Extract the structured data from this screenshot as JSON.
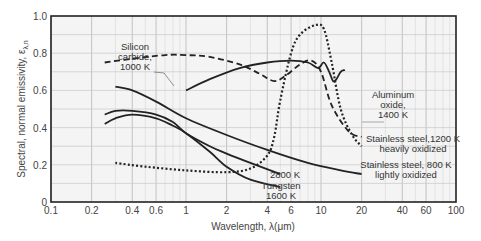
{
  "chart_data": {
    "type": "line",
    "title": "",
    "xlabel": "Wavelength, λ(μm)",
    "ylabel": "Spectral, normal emissivity, ε",
    "ylabel_subscript": "λ,n",
    "xscale": "log",
    "xlim": [
      0.1,
      100
    ],
    "ylim": [
      0,
      1.0
    ],
    "grid": true,
    "x_ticks": [
      0.1,
      0.2,
      0.4,
      0.6,
      1,
      2,
      4,
      6,
      10,
      20,
      40,
      60,
      100
    ],
    "x_tick_labels": [
      "0.1",
      "0.2",
      "0.4",
      "0.6",
      "1",
      "2",
      "4",
      "6",
      "10",
      "20",
      "40",
      "60",
      "100"
    ],
    "y_ticks": [
      0,
      0.2,
      0.4,
      0.6,
      0.8,
      1.0
    ],
    "y_tick_labels": [
      "0",
      "0.2",
      "0.4",
      "0.6",
      "0.8",
      "1.0"
    ],
    "series": [
      {
        "name": "Silicon carbide, 1000 K",
        "style": "dashed",
        "x": [
          0.25,
          0.4,
          0.7,
          1.0,
          1.5,
          2.5,
          3.5,
          4.5,
          5.5,
          7.0,
          8.5,
          10,
          12,
          16,
          20
        ],
        "y": [
          0.75,
          0.77,
          0.79,
          0.79,
          0.78,
          0.74,
          0.69,
          0.65,
          0.68,
          0.74,
          0.76,
          0.7,
          0.52,
          0.38,
          0.35
        ]
      },
      {
        "name": "Aluminum oxide, 1400 K",
        "style": "dotted",
        "x": [
          0.3,
          0.5,
          1.0,
          2.0,
          3.0,
          4.0,
          4.5,
          5.0,
          6.0,
          7.0,
          9.0,
          10.5,
          12,
          14,
          17,
          20
        ],
        "y": [
          0.21,
          0.19,
          0.17,
          0.16,
          0.18,
          0.25,
          0.35,
          0.55,
          0.8,
          0.9,
          0.95,
          0.93,
          0.75,
          0.5,
          0.36,
          0.3
        ]
      },
      {
        "name": "Stainless steel, 1200 K heavily oxidized",
        "style": "solid",
        "x": [
          1.0,
          1.5,
          2.5,
          4.0,
          6.0,
          8.0,
          9.5,
          10.5,
          11.5,
          12.3,
          13.0,
          14.0,
          15.0
        ],
        "y": [
          0.6,
          0.66,
          0.72,
          0.75,
          0.76,
          0.75,
          0.72,
          0.75,
          0.7,
          0.65,
          0.66,
          0.7,
          0.71
        ]
      },
      {
        "name": "Stainless steel, 800 K lightly oxidized",
        "style": "solid",
        "x": [
          0.3,
          0.4,
          0.6,
          1.0,
          2.0,
          4.0,
          8.0,
          14.0,
          20.0
        ],
        "y": [
          0.62,
          0.6,
          0.54,
          0.45,
          0.36,
          0.28,
          0.21,
          0.17,
          0.15
        ]
      },
      {
        "name": "Tungsten, 2800 K",
        "style": "solid",
        "x": [
          0.25,
          0.3,
          0.4,
          0.6,
          0.8,
          1.0,
          1.5,
          2.0,
          3.0,
          5.0
        ],
        "y": [
          0.47,
          0.49,
          0.49,
          0.47,
          0.43,
          0.37,
          0.3,
          0.26,
          0.21,
          0.15
        ]
      },
      {
        "name": "Tungsten, 1600 K",
        "style": "solid",
        "x": [
          0.25,
          0.3,
          0.4,
          0.6,
          0.8,
          1.0,
          1.5,
          2.0,
          3.0,
          5.0
        ],
        "y": [
          0.42,
          0.45,
          0.47,
          0.45,
          0.41,
          0.37,
          0.27,
          0.19,
          0.12,
          0.08
        ]
      }
    ],
    "annotations": [
      {
        "text": [
          "Silicon",
          "carbide,",
          "1000 K"
        ],
        "x": 0.63,
        "y": 0.66
      },
      {
        "text": [
          "Aluminum",
          "oxide,",
          "1400 K"
        ],
        "x": 30,
        "y": 0.52
      },
      {
        "text": [
          "Stainless steel,1200 K",
          "heavily oxidized"
        ],
        "x": 45,
        "y": 0.33
      },
      {
        "text": [
          "Stainless steel, 800 K",
          "lightly oxidized"
        ],
        "x": 45,
        "y": 0.14
      },
      {
        "text": [
          "2800 K"
        ],
        "x": 5.8,
        "y": 0.14
      },
      {
        "text": [
          "Tungsten",
          "1600 K"
        ],
        "x": 5.3,
        "y": 0.05
      }
    ]
  },
  "axes": {
    "xlabel": "Wavelength, λ(μm)",
    "ylabel_main": "Spectral, normal emissivity, ε",
    "ylabel_sub": "λ,n"
  }
}
